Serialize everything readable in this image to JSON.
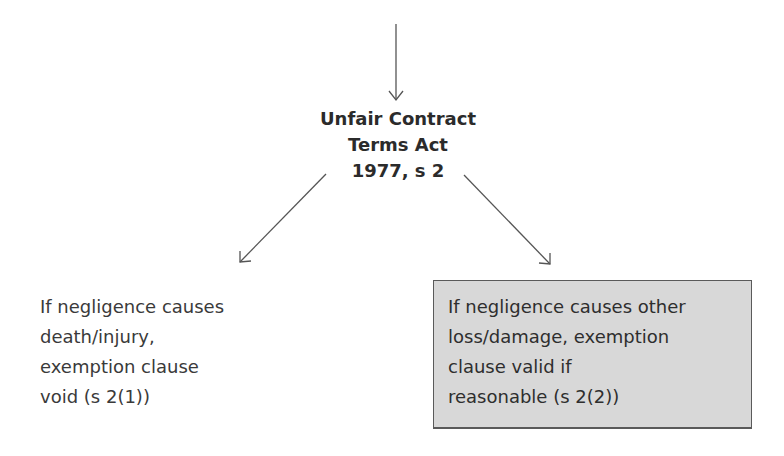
{
  "diagram": {
    "title": {
      "lines": [
        "Unfair Contract",
        "Terms Act",
        "1977, s 2"
      ]
    },
    "left_branch": {
      "lines": [
        "If negligence causes",
        "death/injury,",
        "exemption clause",
        "void (s 2(1))"
      ]
    },
    "right_branch": {
      "lines": [
        "If negligence causes other",
        "loss/damage, exemption",
        "clause valid if",
        "reasonable (s 2(2))"
      ],
      "box_color": "#d8d8d8",
      "border_color": "#5a5a5a"
    },
    "arrow_color": "#555555"
  }
}
